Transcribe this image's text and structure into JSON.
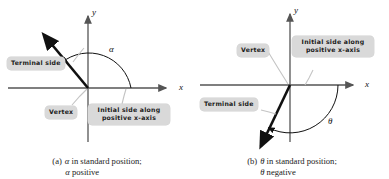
{
  "figure": {
    "background": "#ffffff",
    "axis_color": "#555555",
    "ray_color": "#111111",
    "arc_color": "#111111",
    "callout_bg": "#d9d9d9",
    "leader_color": "#bdbdbd"
  },
  "panels": [
    {
      "id": "a",
      "axes": {
        "x_label": "x",
        "y_label": "y"
      },
      "angle_symbol": "α",
      "callouts": [
        {
          "name": "terminal-side",
          "text": "Terminal side"
        },
        {
          "name": "vertex",
          "text": "Vertex"
        },
        {
          "name": "initial-side",
          "line1": "Initial side along",
          "line2": "positive x-axis"
        }
      ],
      "caption": {
        "marker": "(a)",
        "line1_symbol": "α",
        "line1_text": " in standard position;",
        "line2_symbol": "α",
        "line2_text": " positive"
      }
    },
    {
      "id": "b",
      "axes": {
        "x_label": "x",
        "y_label": "y"
      },
      "angle_symbol": "θ",
      "callouts": [
        {
          "name": "vertex",
          "text": "Vertex"
        },
        {
          "name": "initial-side",
          "line1": "Initial side along",
          "line2": "positive x-axis"
        },
        {
          "name": "terminal-side",
          "text": "Terminal side"
        }
      ],
      "caption": {
        "marker": "(b)",
        "line1_symbol": "θ",
        "line1_text": " in standard position;",
        "line2_symbol": "θ",
        "line2_text": " negative"
      }
    }
  ]
}
